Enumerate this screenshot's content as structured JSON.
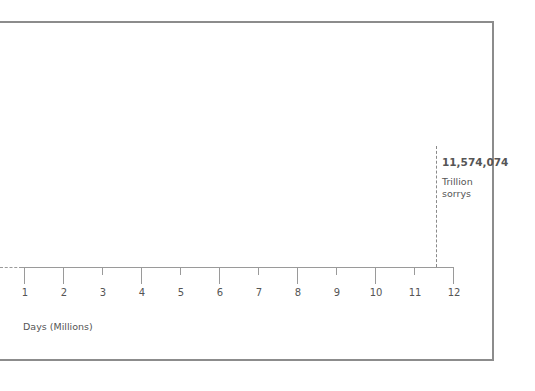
{
  "chart_data": {
    "type": "line",
    "title": "",
    "xlabel": "Days (Millions)",
    "ylabel": "",
    "x_ticks": [
      1,
      2,
      3,
      4,
      5,
      6,
      7,
      8,
      9,
      10,
      11,
      12
    ],
    "x_tick_labels": [
      "1",
      "2",
      "3",
      "4",
      "5",
      "6",
      "7",
      "8",
      "9",
      "10",
      "11",
      "12"
    ],
    "xlim": [
      1,
      12
    ],
    "grid": false,
    "annotations": [
      {
        "x": 11.574074,
        "value_label": "11,574,074",
        "unit_label": "Trillion sorrys",
        "style": "dashed-vertical-marker"
      }
    ]
  },
  "axis": {
    "ticks": [
      {
        "label": "1",
        "x": 24,
        "h": 17
      },
      {
        "label": "2",
        "x": 63,
        "h": 17
      },
      {
        "label": "3",
        "x": 102,
        "h": 8
      },
      {
        "label": "4",
        "x": 141,
        "h": 17
      },
      {
        "label": "5",
        "x": 180,
        "h": 8
      },
      {
        "label": "6",
        "x": 219,
        "h": 17
      },
      {
        "label": "7",
        "x": 258,
        "h": 8
      },
      {
        "label": "8",
        "x": 297,
        "h": 17
      },
      {
        "label": "9",
        "x": 336,
        "h": 8
      },
      {
        "label": "10",
        "x": 375,
        "h": 17
      },
      {
        "label": "11",
        "x": 414,
        "h": 8
      },
      {
        "label": "12",
        "x": 453,
        "h": 17
      }
    ],
    "xlabel": "Days (Millions)"
  },
  "annotation": {
    "value": "11,574,074",
    "unit_line1": "Trillion",
    "unit_line2": "sorrys"
  }
}
